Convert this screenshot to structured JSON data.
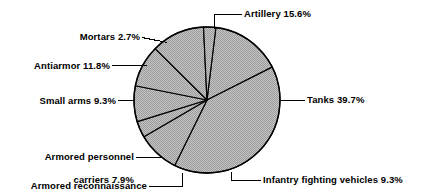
{
  "chart_data": {
    "type": "pie",
    "title": "",
    "subtitle": "",
    "xlabel": "",
    "ylabel": "",
    "legend_position": "none",
    "grid": false,
    "units": "percent",
    "total": 99.9,
    "start_angle_deg": 7,
    "direction": "clockwise",
    "categories": [
      "Artillery",
      "Tanks",
      "Infantry fighting vehicles",
      "Armored reconnaissance vehicles",
      "Armored personnel carriers",
      "Small arms",
      "Antiarmor",
      "Mortars"
    ],
    "values": [
      15.6,
      39.7,
      9.3,
      3.6,
      7.9,
      9.3,
      11.8,
      2.7
    ],
    "slices": [
      {
        "name": "Artillery",
        "value": 15.6,
        "label": "Artillery 15.6%",
        "percent_text": "15.6%"
      },
      {
        "name": "Tanks",
        "value": 39.7,
        "label": "Tanks 39.7%",
        "percent_text": "39.7%"
      },
      {
        "name": "Infantry fighting vehicles",
        "value": 9.3,
        "label": "Infantry fighting vehicles 9.3%",
        "percent_text": "9.3%"
      },
      {
        "name": "Armored reconnaissance vehicles",
        "value": 3.6,
        "label": "Armored reconnaissance vehicles 3.6%",
        "percent_text": "3.6%"
      },
      {
        "name": "Armored personnel carriers",
        "value": 7.9,
        "label": "Armored personnel carriers 7.9%",
        "percent_text": "7.9%"
      },
      {
        "name": "Small arms",
        "value": 9.3,
        "label": "Small arms 9.3%",
        "percent_text": "9.3%"
      },
      {
        "name": "Antiarmor",
        "value": 11.8,
        "label": "Antiarmor 11.8%",
        "percent_text": "11.8%"
      },
      {
        "name": "Mortars",
        "value": 2.7,
        "label": "Mortars 2.7%",
        "percent_text": "2.7%"
      }
    ],
    "colors": {
      "slice_fill": "#b5b5b5",
      "slice_stroke": "#000000",
      "leader_line": "#000000",
      "text": "#000000",
      "background": "#ffffff"
    }
  },
  "labels": {
    "artillery": "Artillery 15.6%",
    "tanks": "Tanks 39.7%",
    "infantry_fighting_vehicles": "Infantry fighting vehicles 9.3%",
    "armored_recon_line1": "Armored reconnaissance",
    "armored_recon_line2": "vehicles 3.6%",
    "armored_personnel_line1": "Armored personnel",
    "armored_personnel_line2": "carriers 7.9%",
    "small_arms": "Small arms 9.3%",
    "antiarmor": "Antiarmor 11.8%",
    "mortars": "Mortars 2.7%"
  }
}
